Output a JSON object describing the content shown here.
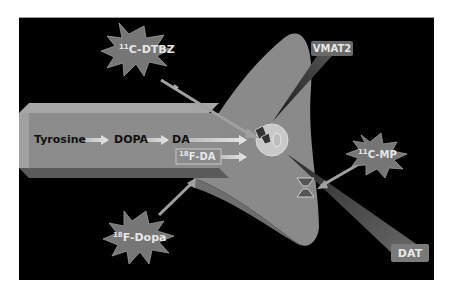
{
  "diagram": {
    "pathway": {
      "steps": [
        "Tyrosine",
        "DOPA",
        "DA"
      ],
      "tracer_product": {
        "isotope": "18",
        "label": "F-DA"
      }
    },
    "tracers": [
      {
        "id": "dtbz",
        "isotope": "11",
        "label": "C-DTBZ",
        "target": "VMAT2"
      },
      {
        "id": "mp",
        "isotope": "11",
        "label": "C-MP",
        "target": "DAT"
      },
      {
        "id": "fdopa",
        "isotope": "18",
        "label": "F-Dopa",
        "target": "18F-DA"
      }
    ],
    "targets": {
      "vmat2": "VMAT2",
      "dat": "DAT"
    },
    "colors": {
      "background": "#000000",
      "axon": "#8c8c8c",
      "terminal": "#8a8a8a",
      "star": "#7a7a7a",
      "arrow": "#b8b8b8"
    }
  }
}
